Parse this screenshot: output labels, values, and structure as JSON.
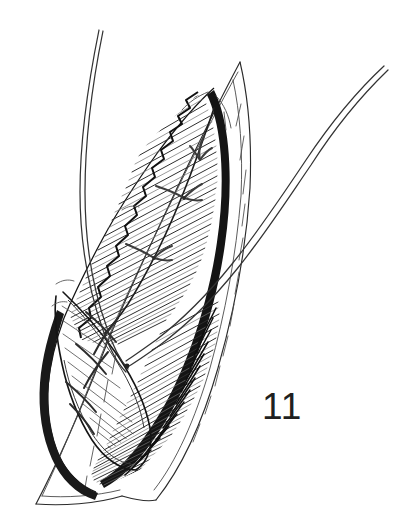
{
  "figure": {
    "number_label": "11",
    "caption": "",
    "kind": "surgical-line-illustration",
    "background_color": "#ffffff",
    "ink_color": "#1a1a1a",
    "midtone_color": "#555555",
    "light_hatch_color": "#8a8a8a",
    "canvas": {
      "width": 397,
      "height": 530
    }
  },
  "elements": {
    "outer_skin_outline_label": "outer skin margin",
    "inner_skin_outline_label": "retracted skin edge",
    "wound_cavity_label": "open wound cavity",
    "hatched_tissue_label": "hatched muscle and fascia",
    "running_suture_label": "running suture line",
    "free_thread_left_label": "free suture thread, upper left",
    "free_thread_right_label": "free suture thread, upper right",
    "deep_flap_label": "deep tissue flap",
    "stitch_count": 7
  },
  "stitches": [
    {
      "name": "stitch-1",
      "x": 196,
      "y": 148
    },
    {
      "name": "stitch-2",
      "x": 178,
      "y": 196
    },
    {
      "name": "stitch-3",
      "x": 147,
      "y": 255
    },
    {
      "name": "stitch-4",
      "x": 105,
      "y": 322
    },
    {
      "name": "stitch-5",
      "x": 93,
      "y": 352
    },
    {
      "name": "stitch-6",
      "x": 80,
      "y": 382
    },
    {
      "name": "stitch-7",
      "x": 72,
      "y": 404
    }
  ]
}
